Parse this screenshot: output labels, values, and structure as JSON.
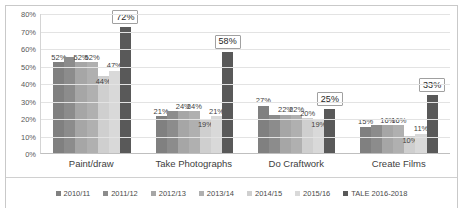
{
  "chart_data": {
    "type": "bar",
    "title": "",
    "xlabel": "",
    "ylabel": "",
    "ylim": [
      0,
      80
    ],
    "grid": true,
    "legend_position": "bottom",
    "categories": [
      "Paint/draw",
      "Take Photographs",
      "Do Craftwork",
      "Create Films"
    ],
    "yticks": [
      "80%",
      "70%",
      "60%",
      "50%",
      "40%",
      "30%",
      "20%",
      "10%",
      "0%"
    ],
    "ytick_values": [
      80,
      70,
      60,
      50,
      40,
      30,
      20,
      10,
      0
    ],
    "series": [
      {
        "name": "2010/11",
        "color": "#808080",
        "values": [
          52,
          21,
          27,
          15
        ],
        "labels": [
          "52%",
          "21%",
          "27%",
          "15%"
        ]
      },
      {
        "name": "2011/12",
        "color": "#8c8c8c",
        "values": [
          55,
          24,
          22,
          16
        ],
        "labels": [
          "",
          "",
          "",
          ""
        ]
      },
      {
        "name": "2012/13",
        "color": "#a6a6a6",
        "values": [
          52,
          24,
          22,
          16
        ],
        "labels": [
          "52%",
          "24%",
          "22%",
          "16%"
        ]
      },
      {
        "name": "2013/14",
        "color": "#b0b0b0",
        "values": [
          52,
          24,
          22,
          16
        ],
        "labels": [
          "52%",
          "24%",
          "22%",
          "16%"
        ]
      },
      {
        "name": "2014/15",
        "color": "#cfcfcf",
        "values": [
          44,
          19,
          20,
          10
        ],
        "labels": [
          "44%",
          "19%",
          "20%",
          "10%"
        ]
      },
      {
        "name": "2015/16",
        "color": "#d9d9d9",
        "values": [
          47,
          21,
          19,
          11
        ],
        "labels": [
          "47%",
          "21%",
          "19%",
          "11%"
        ]
      },
      {
        "name": "TALE 2016-2018",
        "color": "#595959",
        "values": [
          72,
          58,
          25,
          33
        ],
        "labels": [
          "72%",
          "58%",
          "25%",
          "33%"
        ]
      }
    ]
  }
}
